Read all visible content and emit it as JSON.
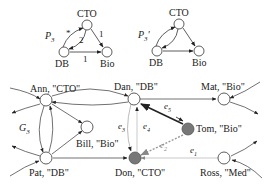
{
  "patterns": [
    {
      "id": "P3",
      "label": "P",
      "subscript": "3",
      "prime": "",
      "nodes": [
        {
          "id": "CTO",
          "label": "CTO"
        },
        {
          "id": "DB",
          "label": "DB"
        },
        {
          "id": "Bio",
          "label": "Bio"
        }
      ],
      "edges": [
        {
          "from": "DB",
          "to": "CTO",
          "label": "*"
        },
        {
          "from": "CTO",
          "to": "DB",
          "label": "2"
        },
        {
          "from": "CTO",
          "to": "Bio",
          "label": "1"
        },
        {
          "from": "DB",
          "to": "Bio",
          "label": "1"
        }
      ]
    },
    {
      "id": "P3prime",
      "label": "P",
      "subscript": "3",
      "prime": "'",
      "nodes": [
        {
          "id": "CTO",
          "label": "CTO"
        },
        {
          "id": "DB",
          "label": "DB"
        },
        {
          "id": "Bio",
          "label": "Bio"
        }
      ],
      "edges": [
        {
          "from": "DB",
          "to": "CTO",
          "label": ""
        },
        {
          "from": "CTO",
          "to": "DB",
          "label": ""
        },
        {
          "from": "CTO",
          "to": "Bio",
          "label": ""
        },
        {
          "from": "DB",
          "to": "Bio",
          "label": ""
        }
      ]
    }
  ],
  "graph": {
    "label": "G",
    "subscript": "3",
    "nodes": [
      {
        "id": "ann",
        "label": "Ann, \"CTO\"",
        "filled": false
      },
      {
        "id": "dan",
        "label": "Dan, \"DB\"",
        "filled": false
      },
      {
        "id": "mat",
        "label": "Mat, \"Bio\"",
        "filled": false
      },
      {
        "id": "bill",
        "label": "Bill, \"Bio\"",
        "filled": false
      },
      {
        "id": "tom",
        "label": "Tom, \"Bio\"",
        "filled": true
      },
      {
        "id": "pat",
        "label": "Pat, \"DB\"",
        "filled": false
      },
      {
        "id": "don",
        "label": "Don, \"CTO\"",
        "filled": true
      },
      {
        "id": "ross",
        "label": "Ross, \"Med\"",
        "filled": false
      }
    ],
    "edge_labels": [
      {
        "id": "e1",
        "name": "e",
        "sub": "1"
      },
      {
        "id": "e2",
        "name": "e",
        "sub": "2"
      },
      {
        "id": "e3",
        "name": "e",
        "sub": "3"
      },
      {
        "id": "e4",
        "name": "e",
        "sub": "4"
      },
      {
        "id": "e5",
        "name": "e",
        "sub": "5"
      }
    ]
  },
  "colors": {
    "line": "#333333",
    "light_line": "#aaaaaa",
    "filled_node": "#777777",
    "dashed_edge": "#999999"
  }
}
